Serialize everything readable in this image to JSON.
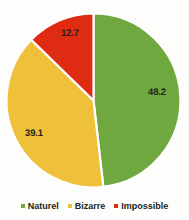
{
  "chart_data": {
    "type": "pie",
    "title": "",
    "subtitle": "",
    "xlabel": "",
    "ylabel": "",
    "grid": false,
    "legend_position": "bottom",
    "start_angle_deg": 0,
    "direction": "clockwise",
    "categories": [
      "Naturel",
      "Bizarre",
      "Impossible"
    ],
    "values": [
      48.2,
      39.1,
      12.7
    ],
    "value_labels": [
      "48.2",
      "39.1",
      "12.7"
    ],
    "colors": [
      "#6FA83F",
      "#EFC03A",
      "#E02B13"
    ],
    "slices": [
      {
        "name": "Naturel",
        "value": 48.2,
        "label": "48.2",
        "color": "#6FA83F",
        "start_deg": 0,
        "end_deg": 173.52,
        "label_x": 157,
        "label_y": 92
      },
      {
        "name": "Bizarre",
        "value": 39.1,
        "label": "39.1",
        "color": "#EFC03A",
        "start_deg": 173.52,
        "end_deg": 314.28,
        "label_x": 34,
        "label_y": 133
      },
      {
        "name": "Impossible",
        "value": 12.7,
        "label": "12.7",
        "color": "#E02B13",
        "start_deg": 314.28,
        "end_deg": 360,
        "label_x": 70,
        "label_y": 33
      }
    ]
  },
  "legend": {
    "items": [
      {
        "label": "Naturel",
        "color": "#6FA83F",
        "swatch_name": "legend-swatch-naturel"
      },
      {
        "label": "Bizarre",
        "color": "#EFC03A",
        "swatch_name": "legend-swatch-bizarre"
      },
      {
        "label": "Impossible",
        "color": "#E02B13",
        "swatch_name": "legend-swatch-impossible"
      }
    ]
  },
  "geometry": {
    "center_x": 93.5,
    "center_y": 100.5,
    "radius": 87
  }
}
